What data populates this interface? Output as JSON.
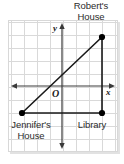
{
  "figure": {
    "type": "coordinate-plane-diagram",
    "background_color": "#ffffff",
    "grid_color": "#d9d9d9",
    "axis_color": "#3a3a3a",
    "line_color": "#1a1a1a",
    "point_color": "#000000",
    "grid_spacing_px": 13
  },
  "axes": {
    "y_label": "y",
    "x_label": "x",
    "origin_label": "O",
    "origin_px": {
      "x": 62,
      "y": 86
    },
    "y_axis_x_px": 62,
    "x_axis_y_px": 86,
    "x_axis_start_px": 12,
    "x_axis_end_px": 114,
    "y_axis_start_px": 24,
    "y_axis_end_px": 148
  },
  "points": [
    {
      "id": "roberts-house",
      "label_line1": "Robert's",
      "label_line2": "House",
      "px": {
        "x": 102,
        "y": 37
      },
      "grid_coords": {
        "x": 3,
        "y": 4
      }
    },
    {
      "id": "jennifers-house",
      "label_line1": "Jennifer's",
      "label_line2": "House",
      "px": {
        "x": 22,
        "y": 113
      },
      "grid_coords": {
        "x": -3,
        "y": -2
      }
    },
    {
      "id": "library",
      "label_line1": "Library",
      "label_line2": "",
      "px": {
        "x": 102,
        "y": 113
      },
      "grid_coords": {
        "x": 3,
        "y": -2
      }
    }
  ],
  "segments": [
    {
      "id": "jennifers-to-roberts",
      "from": "jennifers-house",
      "to": "roberts-house"
    },
    {
      "id": "roberts-to-library",
      "from": "roberts-house",
      "to": "library"
    },
    {
      "id": "jennifers-to-library",
      "from": "jennifers-house",
      "to": "library"
    }
  ]
}
